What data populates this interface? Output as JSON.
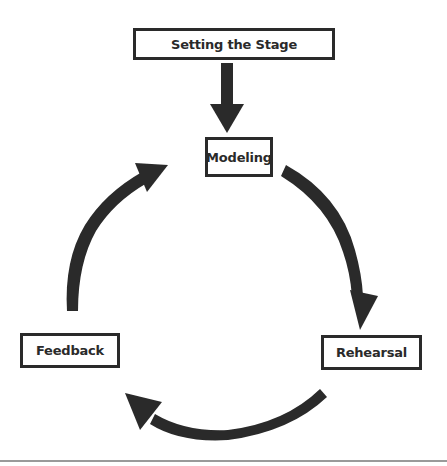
{
  "diagram": {
    "type": "cycle-flow",
    "colors": {
      "stroke": "#2a2a2a",
      "background": "#ffffff",
      "divider": "#9a9a9a"
    },
    "nodes": [
      {
        "id": "setting-the-stage",
        "label": "Setting the Stage"
      },
      {
        "id": "modeling",
        "label": "Modeling"
      },
      {
        "id": "rehearsal",
        "label": "Rehearsal"
      },
      {
        "id": "feedback",
        "label": "Feedback"
      }
    ],
    "edges": [
      {
        "from": "setting-the-stage",
        "to": "modeling",
        "style": "straight-down-arrow"
      },
      {
        "from": "modeling",
        "to": "rehearsal",
        "style": "curved-arrow-clockwise"
      },
      {
        "from": "rehearsal",
        "to": "feedback",
        "style": "curved-arrow-clockwise"
      },
      {
        "from": "feedback",
        "to": "modeling",
        "style": "curved-arrow-clockwise"
      }
    ]
  }
}
